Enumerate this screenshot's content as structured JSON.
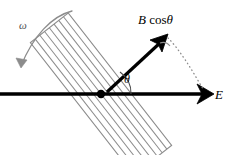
{
  "figure": {
    "labels": {
      "b_component": "B",
      "b_component_fn": "cos",
      "b_component_angle": "θ",
      "angle": "θ",
      "angular_velocity": "ω",
      "field": "E"
    },
    "colors": {
      "stroke": "#000000",
      "hatch": "#8c8c8c",
      "rotation_arrow": "#8c8c8c",
      "dotted": "#8c8c8c",
      "background": "#ffffff"
    },
    "geometry": {
      "pivot": {
        "x": 101,
        "y": 94
      },
      "e_axis": {
        "x1": 0,
        "y1": 94,
        "x2": 212,
        "y2": 94
      },
      "b_vector": {
        "x1": 106,
        "y1": 92,
        "x2": 166,
        "y2": 37
      },
      "angle_degrees": 43,
      "slab_angle_degrees": 52,
      "hatch_line_count": 7
    }
  }
}
